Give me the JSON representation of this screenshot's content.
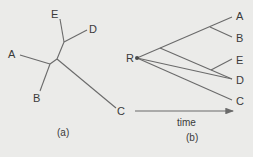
{
  "figure": {
    "panel_a": {
      "caption": "(a)",
      "description": "Unrooted tree",
      "leaves": [
        "A",
        "B",
        "C",
        "D",
        "E"
      ]
    },
    "panel_b": {
      "caption": "(b)",
      "description": "Rooted tree",
      "root_label": "R",
      "leaves": [
        "A",
        "B",
        "E",
        "D",
        "C"
      ],
      "axis_label": "time"
    }
  },
  "colors": {
    "background": "#ebebe9",
    "line": "#6a6a6a",
    "text": "#3a3a3a"
  }
}
